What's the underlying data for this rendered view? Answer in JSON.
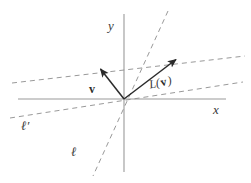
{
  "figure": {
    "type": "geometry-diagram",
    "background_color": "#ffffff",
    "axis_color": "#9a9a9a",
    "dashed_color": "#8d8d8d",
    "vector_color": "#2b2b2b",
    "label_color": "#3a3a3a",
    "origin": {
      "x": 124,
      "y": 99
    }
  },
  "axes": {
    "x_axis": {
      "label": "x",
      "label_pos": {
        "x": 215,
        "y": 113
      },
      "from": {
        "x": 18,
        "y": 99
      },
      "to": {
        "x": 226,
        "y": 99
      }
    },
    "y_axis": {
      "label": "y",
      "label_pos": {
        "x": 108,
        "y": 30
      },
      "from": {
        "x": 124,
        "y": 14
      },
      "to": {
        "x": 124,
        "y": 172
      }
    }
  },
  "lines": [
    {
      "name": "line-ell",
      "label": "ℓ",
      "label_pos": {
        "x": 72,
        "y": 155
      },
      "style": "dashed",
      "from": {
        "x": 168,
        "y": 11
      },
      "to": {
        "x": 93,
        "y": 176
      }
    },
    {
      "name": "line-ell-prime",
      "label": "ℓ′",
      "label_pos": {
        "x": 22,
        "y": 129
      },
      "style": "dashed",
      "from": {
        "x": 10,
        "y": 118
      },
      "to": {
        "x": 243,
        "y": 82
      }
    },
    {
      "name": "line-upper-dashed",
      "label": "",
      "style": "dashed",
      "from": {
        "x": 12,
        "y": 83
      },
      "to": {
        "x": 245,
        "y": 56
      }
    }
  ],
  "vectors": [
    {
      "name": "vector-v",
      "label": "v",
      "label_pos": {
        "x": 90,
        "y": 92
      },
      "from": {
        "x": 124,
        "y": 99
      },
      "to": {
        "x": 98,
        "y": 66
      }
    },
    {
      "name": "vector-Lv",
      "label_prefix": "L(",
      "label_symbol": "v",
      "label_suffix": ")",
      "label_pos": {
        "x": 152,
        "y": 88
      },
      "from": {
        "x": 124,
        "y": 99
      },
      "to": {
        "x": 179,
        "y": 57
      }
    }
  ]
}
